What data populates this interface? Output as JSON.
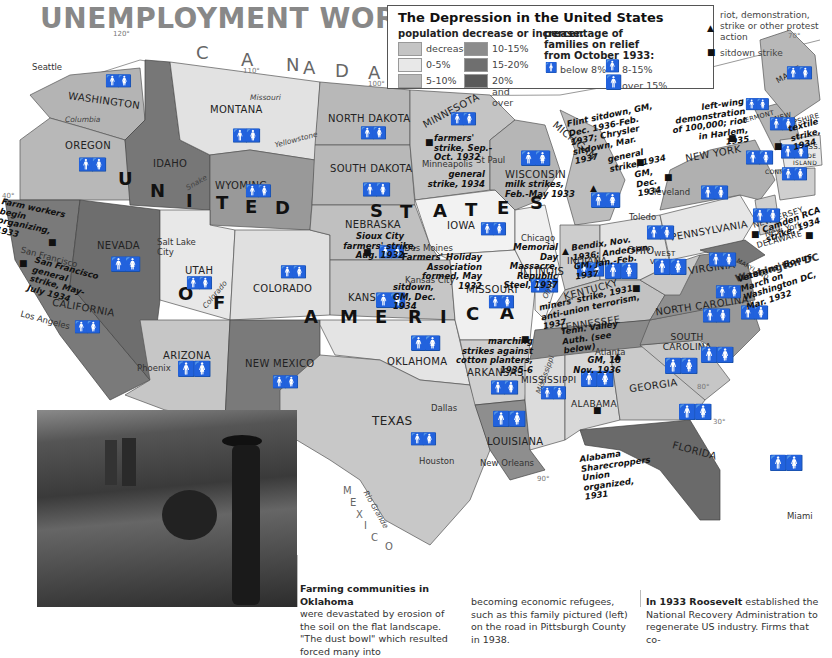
{
  "title": "UNEMPLOYMENT WORLDWIDE",
  "legend": {
    "title": "The Depression in the United States",
    "population_heading": "population decrease or increase:",
    "population_items": [
      {
        "label": "decrease",
        "color": "#c4c4c4"
      },
      {
        "label": "0-5%",
        "color": "#e8e8e8"
      },
      {
        "label": "5-10%",
        "color": "#b8b8b8"
      },
      {
        "label": "10-15%",
        "color": "#8c8c8c"
      },
      {
        "label": "15-20%",
        "color": "#6f6f6f"
      },
      {
        "label": "20% and over",
        "color": "#5a5a5a"
      }
    ],
    "relief_heading": "percentage of families on relief from October 1933:",
    "relief_items": [
      {
        "label": "below 8%",
        "icon": "small-family-icon"
      },
      {
        "label": "8-15%",
        "icon": "medium-family-icon"
      },
      {
        "label": "over 15%",
        "icon": "large-family-icon"
      }
    ],
    "event_items": [
      {
        "label": "riot, demonstration, strike or other protest action",
        "icon": "triangle-icon"
      },
      {
        "label": "sitdown strike",
        "icon": "square-icon"
      }
    ]
  },
  "country_labels": {
    "canada": [
      "C",
      "A",
      "N",
      "A",
      "D",
      "A"
    ],
    "mexico": [
      "M",
      "E",
      "X",
      "I",
      "C",
      "O"
    ],
    "usa": [
      "U",
      "N",
      "I",
      "T",
      "E",
      "D",
      "S",
      "T",
      "A",
      "T",
      "E",
      "S",
      "O",
      "F",
      "A",
      "M",
      "E",
      "R",
      "I",
      "C",
      "A"
    ]
  },
  "states": [
    "WASHINGTON",
    "OREGON",
    "CALIFORNIA",
    "NEVADA",
    "IDAHO",
    "MONTANA",
    "WYOMING",
    "UTAH",
    "ARIZONA",
    "COLORADO",
    "NEW MEXICO",
    "NORTH DAKOTA",
    "SOUTH DAKOTA",
    "NEBRASKA",
    "KANSAS",
    "OKLAHOMA",
    "TEXAS",
    "MINNESOTA",
    "IOWA",
    "MISSOURI",
    "ARKANSAS",
    "LOUISIANA",
    "WISCONSIN",
    "ILLINOIS",
    "MICHIGAN",
    "INDIANA",
    "OHIO",
    "KENTUCKY",
    "TENNESSEE",
    "MISSISSIPPI",
    "ALABAMA",
    "GEORGIA",
    "FLORIDA",
    "SOUTH CAROLINA",
    "NORTH CAROLINA",
    "VIRGINIA",
    "WEST VIRGINIA",
    "PENNSYLVANIA",
    "NEW YORK",
    "NEW JERSEY",
    "DELAWARE",
    "MARYLAND",
    "VERMONT",
    "NEW HAMPSHIRE",
    "MAINE",
    "MASS.",
    "CONN.",
    "RHODE ISLAND"
  ],
  "cities": [
    "Seattle",
    "San Francisco",
    "Los Angeles",
    "Salt Lake City",
    "Phoenix",
    "Minneapolis",
    "St Paul",
    "Des Moines",
    "Kansas City",
    "Chicago",
    "Cleveland",
    "Toledo",
    "New York",
    "Washington DC",
    "Atlanta",
    "Dallas",
    "Houston",
    "New Orleans",
    "Miami"
  ],
  "rivers": [
    "Columbia",
    "Snake",
    "Missouri",
    "Yellowstone",
    "Colorado",
    "Ohio",
    "Mississippi",
    "Rio Grande"
  ],
  "degrees": [
    "120°",
    "110°",
    "100°",
    "90°",
    "80°",
    "70°",
    "40°",
    "30°"
  ],
  "events": {
    "farm_workers": "Farm workers begin organizing, 1933",
    "sf_strike": "San Francisco general strike, May-July 1934",
    "mn_farmers": "farmers' strike, Sep.-Oct. 1932",
    "minneapolis": "general strike, 1934",
    "wisconsin": "milk strikes, Feb.-May 1933",
    "flint": "Flint sitdown, GM, Dec. 1936-Feb. 1937; Chrysler sitdown, Mar. 1937",
    "general_1934": "general strike, 1934",
    "gm_dec_1934": "GM, Dec. 1934",
    "harlem": "left-wing demonstration of 100,000; riot in Harlem, 1935",
    "textile": "textile strike, 1934",
    "camden": "Camden RCA strike, 1934",
    "bonus_march": "Veterans' Bonus March on Washington DC, Mar. 1932",
    "sioux_city": "Sioux City farmers' strike, Aug. 1932",
    "farmers_holiday": "Farmers' Holiday Association formed, May 1932",
    "memorial_day": "Memorial Day Massacre, Republic Steel, 1937",
    "bendix": "Bendix, Nov. 1936; Anderson, GM, Jan.-Feb. 1937",
    "kansas_city": "sitdown, GM, Dec. 1934",
    "kentucky": "miners' strike, 1931 anti-union terrorism, 1937",
    "tennessee": "Tenn. Valley Auth. (see below)",
    "marching": "marching strikes against cotton planters, 1935-6",
    "atlanta": "GM, 18 Nov. 1936",
    "alabama": "Alabama Sharecroppers Union organized, 1931"
  },
  "captions": {
    "col1_bold": "Farming communities in Oklahoma",
    "col1_text": "were devastated by erosion of the soil on the flat landscape. \"The dust bowl\" which resulted forced many into",
    "col2_text": "becoming economic refugees, such as this family pictured (left) on the road in Pittsburgh County in 1938.",
    "col3_bold": "In 1933 Roosevelt",
    "col3_text": "established the National Recovery Administration to regenerate US industry. Firms that co-"
  }
}
